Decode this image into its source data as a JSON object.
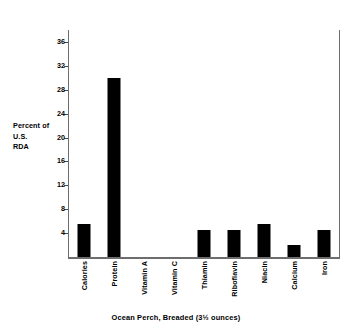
{
  "chart_data": {
    "type": "bar",
    "title": "",
    "xlabel": "Ocean Perch, Breaded (3½ ounces)",
    "ylabel": "Percent of U.S. RDA",
    "ylabel_lines": [
      "Percent of",
      "U.S.",
      "RDA"
    ],
    "categories": [
      "Calories",
      "Protein",
      "Vitamin A",
      "Vitamin C",
      "Thiamin",
      "Riboflavin",
      "Niacin",
      "Calcium",
      "Iron"
    ],
    "values": [
      5.5,
      30,
      0,
      0,
      4.5,
      4.5,
      5.5,
      2,
      4.5
    ],
    "ylim": [
      0,
      38
    ],
    "yticks": [
      4,
      8,
      12,
      16,
      20,
      24,
      28,
      32,
      36
    ],
    "ytick_labels": [
      "4",
      "8",
      "12",
      "16",
      "20",
      "24",
      "28",
      "32",
      "36"
    ],
    "grid": false,
    "legend": null,
    "bar_color": "#000000",
    "axis_color": "#6d6d6d",
    "background": "#ffffff"
  }
}
